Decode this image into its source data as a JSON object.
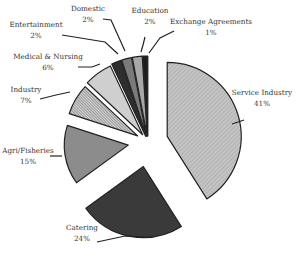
{
  "chart_data": {
    "type": "pie",
    "title": "",
    "exploded": true,
    "start_angle_deg": 0,
    "direction": "clockwise",
    "slices": [
      {
        "label": "Service Industry",
        "value": 41,
        "pct_label": "41%",
        "fill": "#bdbdbd",
        "pattern": "diag-light",
        "radius": 74,
        "offset": 20,
        "label_pos": [
          262,
          97
        ]
      },
      {
        "label": "Catering",
        "value": 24,
        "pct_label": "24%",
        "fill": "#3a3a3a",
        "pattern": "none",
        "radius": 71,
        "offset": 25,
        "label_pos": [
          82,
          232
        ]
      },
      {
        "label": "Agri/Fisheries",
        "value": 15,
        "pct_label": "15%",
        "fill": "#8c8c8c",
        "pattern": "none",
        "radius": 64,
        "offset": 20,
        "label_pos": [
          28,
          155
        ]
      },
      {
        "label": "Industry",
        "value": 7,
        "pct_label": "7%",
        "fill": "#9a9a9a",
        "pattern": "diag-dense",
        "radius": 72,
        "offset": 12,
        "label_pos": [
          26,
          94
        ]
      },
      {
        "label": "Medical & Nursing",
        "value": 6,
        "pct_label": "6%",
        "fill": "#cfcfcf",
        "pattern": "none",
        "radius": 76,
        "offset": 9,
        "label_pos": [
          48,
          61
        ]
      },
      {
        "label": "Entertainment",
        "value": 2,
        "pct_label": "2%",
        "fill": "#2e2e2e",
        "pattern": "none",
        "radius": 80,
        "offset": 6,
        "label_pos": [
          36,
          29
        ]
      },
      {
        "label": "Domestic",
        "value": 2,
        "pct_label": "2%",
        "fill": "#7a7a7a",
        "pattern": "none",
        "radius": 80,
        "offset": 6,
        "label_pos": [
          88,
          13
        ]
      },
      {
        "label": "Education",
        "value": 2,
        "pct_label": "2%",
        "fill": "#a8a8a8",
        "pattern": "none",
        "radius": 80,
        "offset": 6,
        "label_pos": [
          150,
          15
        ]
      },
      {
        "label": "Exchange Agreements",
        "value": 1,
        "pct_label": "1%",
        "fill": "#1e1e1e",
        "pattern": "none",
        "radius": 80,
        "offset": 6,
        "label_pos": [
          211,
          26
        ]
      }
    ],
    "center": [
      148,
      142
    ],
    "legend": "none"
  },
  "leaders": [
    {
      "slice": "Service Industry",
      "points": [
        [
          232,
          124
        ],
        [
          244,
          120
        ]
      ]
    },
    {
      "slice": "Catering",
      "points": [
        [
          97,
          242
        ],
        [
          125,
          236
        ],
        [
          145,
          237
        ]
      ]
    },
    {
      "slice": "Agri/Fisheries",
      "points": [
        [
          50,
          156
        ],
        [
          62,
          156
        ]
      ]
    },
    {
      "slice": "Industry",
      "points": [
        [
          40,
          99
        ],
        [
          56,
          95
        ],
        [
          70,
          92
        ]
      ]
    },
    {
      "slice": "Medical & Nursing",
      "points": [
        [
          78,
          67
        ],
        [
          92,
          67
        ],
        [
          100,
          64
        ]
      ]
    },
    {
      "slice": "Entertainment",
      "points": [
        [
          62,
          35
        ],
        [
          105,
          42
        ],
        [
          118,
          54
        ]
      ]
    },
    {
      "slice": "Domestic",
      "points": [
        [
          103,
          19
        ],
        [
          111,
          20
        ],
        [
          125,
          51
        ]
      ]
    },
    {
      "slice": "Education",
      "points": [
        [
          145,
          37
        ],
        [
          143,
          45
        ],
        [
          141,
          52
        ]
      ]
    },
    {
      "slice": "Exchange Agreements",
      "points": [
        [
          174,
          31
        ],
        [
          160,
          38
        ],
        [
          149,
          53
        ]
      ]
    }
  ]
}
